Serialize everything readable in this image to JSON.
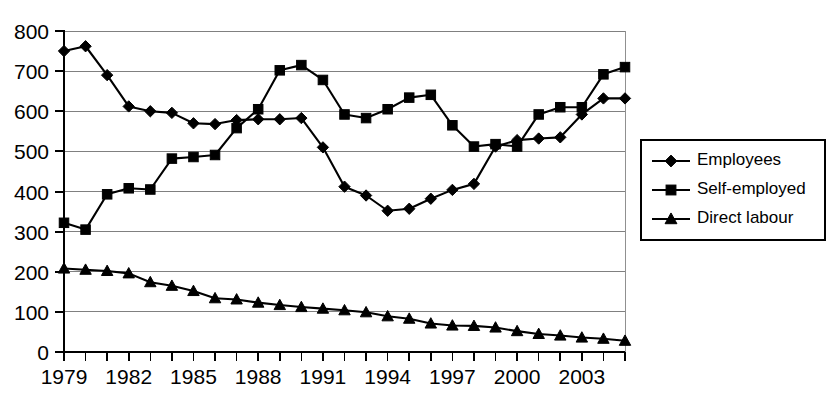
{
  "chart_data": {
    "type": "line",
    "title": "",
    "subtitle": "",
    "xlabel": "",
    "ylabel": "",
    "ylim": [
      0,
      800
    ],
    "ytick_step": 100,
    "yticks": [
      0,
      100,
      200,
      300,
      400,
      500,
      600,
      700,
      800
    ],
    "ytick_labels": [
      "0",
      "100",
      "200",
      "300",
      "400",
      "500",
      "600",
      "700",
      "800"
    ],
    "xlim": [
      1979,
      2005
    ],
    "x": [
      1979,
      1980,
      1981,
      1982,
      1983,
      1984,
      1985,
      1986,
      1987,
      1988,
      1989,
      1990,
      1991,
      1992,
      1993,
      1994,
      1995,
      1996,
      1997,
      1998,
      1999,
      2000,
      2001,
      2002,
      2003,
      2004,
      2005
    ],
    "xtick_labels": [
      "1979",
      "",
      "",
      "1982",
      "",
      "",
      "1985",
      "",
      "",
      "1988",
      "",
      "",
      "1991",
      "",
      "",
      "1994",
      "",
      "",
      "1997",
      "",
      "",
      "2000",
      "",
      "",
      "2003",
      "",
      ""
    ],
    "xticks_labeled": [
      1979,
      1982,
      1985,
      1988,
      1991,
      1994,
      1997,
      2000,
      2003
    ],
    "grid": true,
    "grid_axis": "y",
    "legend_position": "right-outside",
    "series": [
      {
        "name": "Employees",
        "marker": "diamond",
        "color": "#000000",
        "values": [
          750,
          762,
          690,
          612,
          600,
          596,
          570,
          568,
          578,
          580,
          580,
          583,
          510,
          412,
          390,
          352,
          357,
          382,
          404,
          419,
          512,
          528,
          532,
          535,
          592,
          632,
          632
        ]
      },
      {
        "name": "Self-employed",
        "marker": "square",
        "color": "#000000",
        "values": [
          322,
          305,
          393,
          408,
          405,
          482,
          486,
          491,
          558,
          605,
          702,
          715,
          678,
          592,
          583,
          605,
          634,
          641,
          565,
          512,
          518,
          512,
          592,
          610,
          610,
          692,
          710
        ]
      },
      {
        "name": "Direct labour",
        "marker": "triangle",
        "color": "#000000",
        "values": [
          208,
          205,
          202,
          196,
          174,
          165,
          152,
          134,
          131,
          123,
          117,
          112,
          108,
          104,
          99,
          89,
          83,
          71,
          66,
          65,
          61,
          52,
          45,
          41,
          36,
          33,
          28
        ]
      }
    ]
  },
  "legend": {
    "items": [
      {
        "label": "Employees",
        "marker": "diamond"
      },
      {
        "label": "Self-employed",
        "marker": "square"
      },
      {
        "label": "Direct labour",
        "marker": "triangle"
      }
    ]
  }
}
